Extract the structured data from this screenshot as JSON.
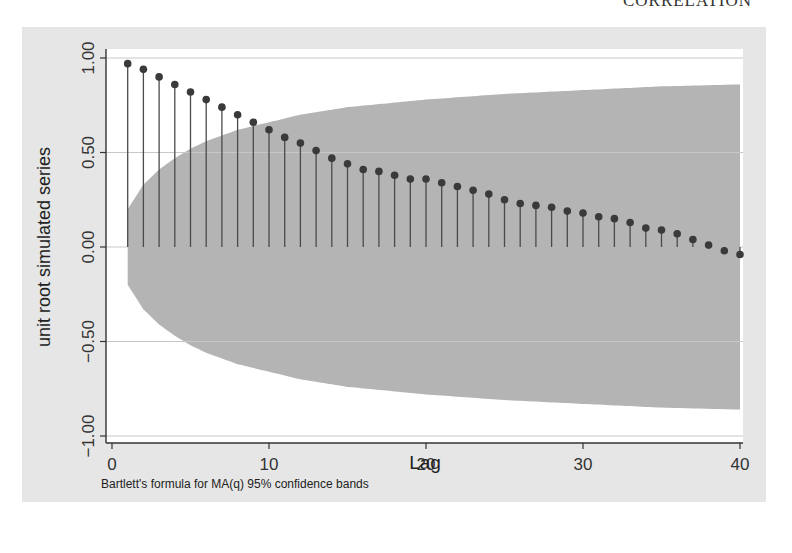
{
  "page": {
    "running_header": "CORRELATION"
  },
  "chart_data": {
    "type": "bar",
    "subtype": "autocorrelation-stem",
    "title": "",
    "xlabel": "Lag",
    "ylabel": "unit root simulated series",
    "note": "Bartlett's formula for MA(q) 95% confidence bands",
    "xlim": [
      0,
      40
    ],
    "ylim": [
      -1.0,
      1.0
    ],
    "x_ticks": [
      0,
      10,
      20,
      30,
      40
    ],
    "x_tick_labels": [
      "0",
      "10",
      "20",
      "30",
      "40"
    ],
    "y_ticks": [
      -1.0,
      -0.5,
      0.0,
      0.5,
      1.0
    ],
    "y_tick_labels": [
      "−1.00",
      "−0.50",
      "0.00",
      "0.50",
      "1.00"
    ],
    "grid": "horizontal",
    "legend": "none",
    "x": [
      1,
      2,
      3,
      4,
      5,
      6,
      7,
      8,
      9,
      10,
      11,
      12,
      13,
      14,
      15,
      16,
      17,
      18,
      19,
      20,
      21,
      22,
      23,
      24,
      25,
      26,
      27,
      28,
      29,
      30,
      31,
      32,
      33,
      34,
      35,
      36,
      37,
      38,
      39,
      40
    ],
    "series": [
      {
        "name": "autocorrelation",
        "values": [
          0.97,
          0.94,
          0.9,
          0.86,
          0.82,
          0.78,
          0.74,
          0.7,
          0.66,
          0.62,
          0.58,
          0.55,
          0.51,
          0.47,
          0.44,
          0.41,
          0.4,
          0.38,
          0.36,
          0.36,
          0.34,
          0.32,
          0.3,
          0.28,
          0.25,
          0.23,
          0.22,
          0.21,
          0.19,
          0.18,
          0.16,
          0.15,
          0.13,
          0.1,
          0.09,
          0.07,
          0.04,
          0.01,
          -0.02,
          -0.04
        ]
      }
    ],
    "confidence_band": {
      "name": "95% confidence band (Bartlett)",
      "lags": [
        1,
        2,
        3,
        4,
        5,
        6,
        8,
        10,
        12,
        15,
        20,
        25,
        30,
        35,
        40
      ],
      "upper": [
        0.2,
        0.33,
        0.41,
        0.47,
        0.52,
        0.56,
        0.62,
        0.66,
        0.7,
        0.74,
        0.78,
        0.81,
        0.83,
        0.85,
        0.86
      ],
      "lower": [
        -0.2,
        -0.33,
        -0.41,
        -0.47,
        -0.52,
        -0.56,
        -0.62,
        -0.66,
        -0.7,
        -0.74,
        -0.78,
        -0.81,
        -0.83,
        -0.85,
        -0.86
      ]
    },
    "colors": {
      "outer_background": "#e6e6e6",
      "plot_background": "#ffffff",
      "band": "#b4b4b4",
      "stem": "#4a4a4a",
      "marker": "#3a3a3a",
      "gridline": "#c8c8c8",
      "axis": "#333333"
    }
  }
}
